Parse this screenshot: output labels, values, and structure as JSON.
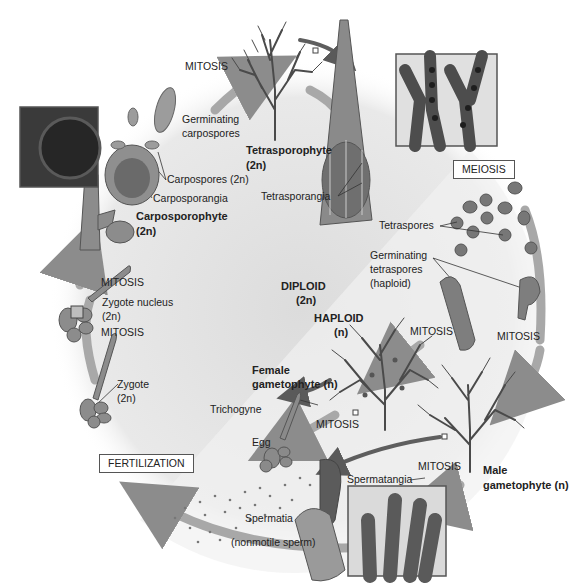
{
  "diagram": {
    "regions": {
      "diploid": {
        "label": "DIPLOID",
        "ploidy": "(2n)"
      },
      "haploid": {
        "label": "HAPLOID",
        "ploidy": "(n)"
      }
    },
    "process_boxes": {
      "meiosis": "MEIOSIS",
      "fertilization": "FERTILIZATION"
    },
    "mitosis_labels": [
      "MITOSIS",
      "MITOSIS",
      "MITOSIS",
      "MITOSIS",
      "MITOSIS",
      "MITOSIS",
      "MITOSIS"
    ],
    "stages": {
      "tetrasporophyte": {
        "name": "Tetrasporophyte",
        "ploidy": "(2n)"
      },
      "tetrasporangia": "Tetrasporangia",
      "tetraspores": "Tetraspores",
      "germinating_tetraspores": [
        "Germinating",
        "tetraspores",
        "(haploid)"
      ],
      "female_gametophyte": {
        "line1": "Female",
        "line2": "gametophyte (n)"
      },
      "male_gametophyte": {
        "line1": "Male",
        "line2": "gametophyte (n)"
      },
      "trichogyne": "Trichogyne",
      "egg": "Egg",
      "spermatangia": "Spermatangia",
      "spermatia": [
        "Spermatia",
        "(nonmotile sperm)"
      ],
      "zygote": [
        "Zygote",
        "(2n)"
      ],
      "zygote_nucleus": [
        "Zygote nucleus",
        "(2n)"
      ],
      "carposporophyte": {
        "name": "Carposporophyte",
        "ploidy": "(2n)"
      },
      "carposporangia": "Carposporangia",
      "carpospores": "Carpospores (2n)",
      "germinating_carpospores": [
        "Germinating",
        "carpospores"
      ]
    },
    "colors": {
      "diploid_region": "#e6e6e6",
      "haploid_region": "#efefef",
      "cycle_arrow": "#9a9a9a",
      "organism_dark": "#4a4a4a",
      "organism_mid": "#7a7a7a",
      "label_box_border": "#555555"
    }
  }
}
